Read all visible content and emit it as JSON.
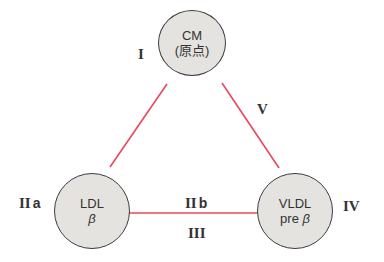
{
  "diagram": {
    "colors": {
      "edge": "#e8485a",
      "node_fill": "#e5e3e0",
      "node_border": "#3c3c3c",
      "text": "#333333"
    },
    "nodes": {
      "cm": {
        "label": "CM",
        "sub": "(原点)"
      },
      "ldl": {
        "label": "LDL",
        "sub": "β"
      },
      "vldl": {
        "label": "VLDL",
        "sub_prefix": "pre ",
        "sub": "β"
      }
    },
    "type_labels": {
      "t1": "I",
      "t2a_roman": "II",
      "t2a_letter": "a",
      "t2b_roman": "II",
      "t2b_letter": "b",
      "t3": "III",
      "t4": "IV",
      "t5": "V"
    },
    "edges": [
      {
        "from": "CM",
        "to": "LDL"
      },
      {
        "from": "CM",
        "to": "VLDL"
      },
      {
        "from": "LDL",
        "to": "VLDL"
      }
    ]
  }
}
